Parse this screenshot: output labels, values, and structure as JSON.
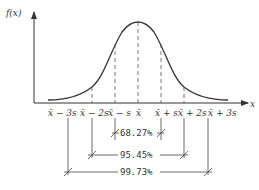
{
  "diagram": {
    "type": "normal-distribution",
    "y_axis_label": "f(x)",
    "x_axis_label": "x",
    "tick_labels": [
      "x̄ − 3s",
      "x̄ − 2s",
      "x̄ − s",
      "x̄",
      "x̄ + s",
      "x̄ + 2s",
      "x̄ + 3s"
    ],
    "intervals": [
      {
        "label": "68.27%",
        "range": "x̄ ± s"
      },
      {
        "label": "95.45%",
        "range": "x̄ ± 2s"
      },
      {
        "label": "99.73%",
        "range": "x̄ ± 3s"
      }
    ],
    "colors": {
      "line": "#333333",
      "background": "#ffffff"
    }
  }
}
